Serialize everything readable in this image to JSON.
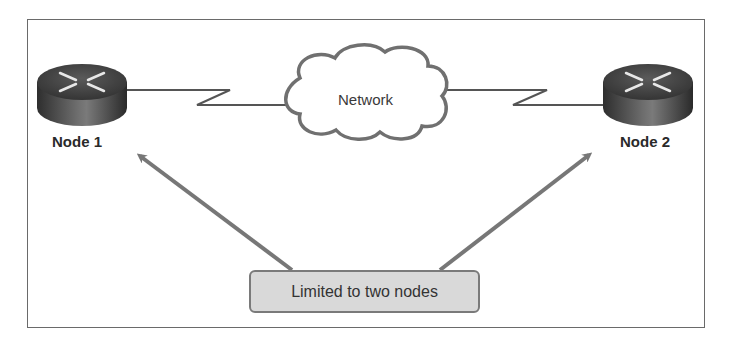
{
  "diagram": {
    "nodes": [
      {
        "id": "node1",
        "label": "Node 1",
        "type": "router"
      },
      {
        "id": "node2",
        "label": "Node 2",
        "type": "router"
      }
    ],
    "cloud": {
      "label": "Network"
    },
    "links": [
      {
        "from": "node1",
        "to": "cloud",
        "type": "serial"
      },
      {
        "from": "cloud",
        "to": "node2",
        "type": "serial"
      }
    ],
    "callout": {
      "label": "Limited to two nodes",
      "points_to": [
        "node1",
        "node2"
      ]
    },
    "colors": {
      "frame": "#6a6a6a",
      "arrow": "#777777",
      "callout_fill": "#d9d9d9",
      "router_body": "#3a3a3a"
    }
  }
}
